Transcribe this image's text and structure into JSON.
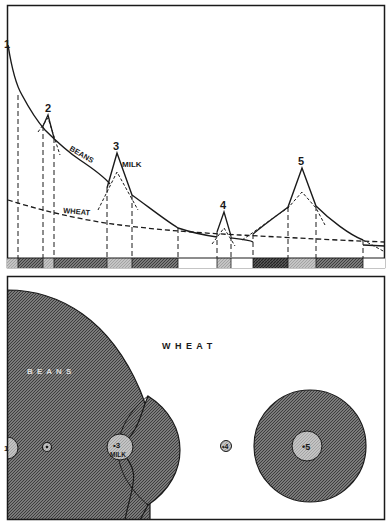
{
  "top_panel": {
    "curves": {
      "beans": {
        "label": "BEANS"
      },
      "wheat": {
        "label": "WHEAT"
      },
      "milk": {
        "label": "MILK"
      }
    },
    "markets": [
      {
        "id": "1",
        "label": "1"
      },
      {
        "id": "2",
        "label": "2"
      },
      {
        "id": "3",
        "label": "3"
      },
      {
        "id": "4",
        "label": "4"
      },
      {
        "id": "5",
        "label": "5"
      }
    ],
    "strip_segments": [
      {
        "x0": 7,
        "x1": 18,
        "fill": "light"
      },
      {
        "x0": 18,
        "x1": 43,
        "fill": "dark"
      },
      {
        "x0": 43,
        "x1": 54,
        "fill": "light"
      },
      {
        "x0": 54,
        "x1": 107,
        "fill": "dark"
      },
      {
        "x0": 107,
        "x1": 132,
        "fill": "light"
      },
      {
        "x0": 132,
        "x1": 178,
        "fill": "dark"
      },
      {
        "x0": 178,
        "x1": 217,
        "fill": "white"
      },
      {
        "x0": 217,
        "x1": 231,
        "fill": "light"
      },
      {
        "x0": 231,
        "x1": 253,
        "fill": "white"
      },
      {
        "x0": 253,
        "x1": 288,
        "fill": "darker"
      },
      {
        "x0": 288,
        "x1": 316,
        "fill": "light"
      },
      {
        "x0": 316,
        "x1": 363,
        "fill": "dark"
      },
      {
        "x0": 363,
        "x1": 385,
        "fill": "white"
      }
    ]
  },
  "bottom_panel": {
    "region_labels": {
      "wheat": "W H E A T",
      "beans": "B E A N S"
    },
    "markets": [
      {
        "id": "1",
        "label": "1"
      },
      {
        "id": "2",
        "label": "2"
      },
      {
        "id": "3",
        "label": "•3",
        "sublabel": "MILK"
      },
      {
        "id": "4",
        "label": "•4"
      },
      {
        "id": "5",
        "label": "•5"
      }
    ]
  },
  "colors": {
    "ink": "#1a1a1a",
    "dark_fill": "#6f6f6f",
    "light_fill": "#bdbdbd",
    "paper": "#ffffff"
  }
}
